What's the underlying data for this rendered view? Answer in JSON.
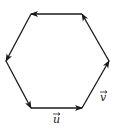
{
  "diagram": {
    "type": "vector-hexagon",
    "stroke_color": "#1a1a1a",
    "background": "#ffffff",
    "vertices": [
      {
        "id": "A",
        "x": 31,
        "y": 108
      },
      {
        "id": "B",
        "x": 82,
        "y": 108
      },
      {
        "id": "C",
        "x": 109,
        "y": 61
      },
      {
        "id": "D",
        "x": 82,
        "y": 14
      },
      {
        "id": "E",
        "x": 31,
        "y": 14
      },
      {
        "id": "F",
        "x": 6,
        "y": 61
      }
    ],
    "edges": [
      {
        "from": "A",
        "to": "B",
        "label": "u"
      },
      {
        "from": "B",
        "to": "C",
        "label": "v"
      },
      {
        "from": "C",
        "to": "D",
        "label": ""
      },
      {
        "from": "D",
        "to": "E",
        "label": ""
      },
      {
        "from": "E",
        "to": "F",
        "label": ""
      },
      {
        "from": "F",
        "to": "A",
        "label": ""
      }
    ],
    "labels": {
      "u": "u",
      "v": "v"
    }
  }
}
